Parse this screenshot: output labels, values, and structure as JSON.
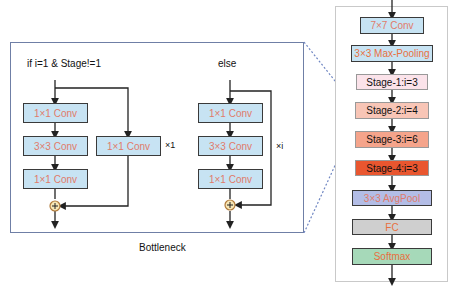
{
  "bottleneck_panel": {
    "caption": "Bottleneck",
    "branch_if": {
      "condition_label": "if   i=1 & Stage!=1",
      "main_path": [
        "1×1 Conv",
        "3×3 Conv",
        "1×1 Conv"
      ],
      "shortcut": "1×1 Conv",
      "repeat_label": "×1"
    },
    "branch_else": {
      "condition_label": "else",
      "main_path": [
        "1×1 Conv",
        "3×3 Conv",
        "1×1 Conv"
      ],
      "repeat_label": "×i"
    },
    "add_symbol": "+"
  },
  "network_panel": {
    "layers": [
      {
        "label": "7×7 Conv",
        "fill": "#c7e3f3",
        "text_color": "#e07b6a"
      },
      {
        "label": "3×3 Max-Pooling",
        "fill": "#c7e3f3",
        "text_color": "#e8703f"
      },
      {
        "label": "Stage-1:i=3",
        "fill": "#fbe3ea",
        "text_color": "#111111"
      },
      {
        "label": "Stage-2:i=4",
        "fill": "#f8c5b6",
        "text_color": "#111111"
      },
      {
        "label": "Stage-3:i=6",
        "fill": "#f5a48b",
        "text_color": "#111111"
      },
      {
        "label": "Stage-4:i=3",
        "fill": "#e9562f",
        "text_color": "#111111"
      },
      {
        "label": "3×3 AvgPool",
        "fill": "#b3bde6",
        "text_color": "#e07b6a"
      },
      {
        "label": "FC",
        "fill": "#cfcfcf",
        "text_color": "#e8703f"
      },
      {
        "label": "Softmax",
        "fill": "#a6d9b9",
        "text_color": "#e8703f"
      }
    ]
  },
  "colors": {
    "panel_border": "#6f7fa6",
    "dashed_connector": "#6f86c2",
    "arrow": "#222222",
    "add_circle_fill": "#f7e6b5",
    "add_circle_stroke": "#b07a3a"
  }
}
